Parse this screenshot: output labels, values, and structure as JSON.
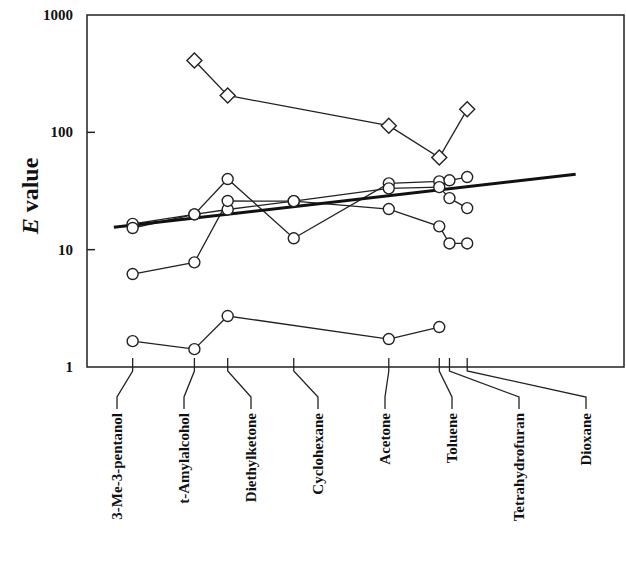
{
  "chart_data": {
    "type": "line",
    "title": "",
    "xlabel": "",
    "ylabel": {
      "italic": "E",
      "rest": " value"
    },
    "yscale": "log",
    "ylim": [
      1,
      1000
    ],
    "yticks": [
      {
        "value": 1,
        "label": "1"
      },
      {
        "value": 10,
        "label": "10"
      },
      {
        "value": 100,
        "label": "100"
      },
      {
        "value": 1000,
        "label": "1000"
      }
    ],
    "grid": false,
    "legend": "none",
    "categories": [
      {
        "name": "3-Me-3-pentanol",
        "pos": 0.085
      },
      {
        "name": "t-Amylalcohol",
        "pos": 0.2
      },
      {
        "name": "Diethylketone",
        "pos": 0.262
      },
      {
        "name": "Cyclohexane",
        "pos": 0.385
      },
      {
        "name": "Acetone",
        "pos": 0.562
      },
      {
        "name": "Toluene",
        "pos": 0.656
      },
      {
        "name": "Tetrahydrofuran",
        "pos": 0.675
      },
      {
        "name": "Dioxane",
        "pos": 0.708
      }
    ],
    "series": [
      {
        "name": "diamond-series",
        "marker": "diamond",
        "points": [
          {
            "cat": 1,
            "y": 410
          },
          {
            "cat": 2,
            "y": 206
          },
          {
            "cat": 4,
            "y": 114
          },
          {
            "cat": 5,
            "y": 61
          },
          {
            "cat": 7,
            "y": 157
          }
        ]
      },
      {
        "name": "circle-series-1",
        "marker": "circle",
        "points": [
          {
            "cat": 0,
            "y": 16.6
          },
          {
            "cat": 1,
            "y": 20
          },
          {
            "cat": 2,
            "y": 40
          },
          {
            "cat": 3,
            "y": 12.5
          },
          {
            "cat": 4,
            "y": 36.7
          },
          {
            "cat": 5,
            "y": 38.2
          },
          {
            "cat": 6,
            "y": 39
          },
          {
            "cat": 7,
            "y": 41.6
          }
        ]
      },
      {
        "name": "circle-series-2",
        "marker": "circle",
        "points": [
          {
            "cat": 0,
            "y": 15.3
          },
          {
            "cat": 1,
            "y": 20
          },
          {
            "cat": 2,
            "y": 22
          },
          {
            "cat": 3,
            "y": 25.9
          },
          {
            "cat": 4,
            "y": 33.3
          },
          {
            "cat": 5,
            "y": 34.1
          },
          {
            "cat": 6,
            "y": 27.5
          },
          {
            "cat": 7,
            "y": 22.6
          }
        ]
      },
      {
        "name": "circle-series-3",
        "marker": "circle",
        "points": [
          {
            "cat": 0,
            "y": 6.2
          },
          {
            "cat": 1,
            "y": 7.8
          },
          {
            "cat": 2,
            "y": 26
          },
          {
            "cat": 3,
            "y": 25.9
          },
          {
            "cat": 4,
            "y": 22.2
          },
          {
            "cat": 5,
            "y": 15.8
          },
          {
            "cat": 6,
            "y": 11.3
          },
          {
            "cat": 7,
            "y": 11.3
          }
        ]
      },
      {
        "name": "circle-series-4",
        "marker": "circle",
        "points": [
          {
            "cat": 0,
            "y": 1.66
          },
          {
            "cat": 1,
            "y": 1.42
          },
          {
            "cat": 2,
            "y": 2.72
          },
          {
            "cat": 4,
            "y": 1.73
          },
          {
            "cat": 5,
            "y": 2.19
          }
        ]
      }
    ],
    "trendline": {
      "name": "regression-line",
      "x_start": 0.05,
      "x_end": 0.91,
      "y_start": 15.5,
      "y_end": 44
    }
  }
}
